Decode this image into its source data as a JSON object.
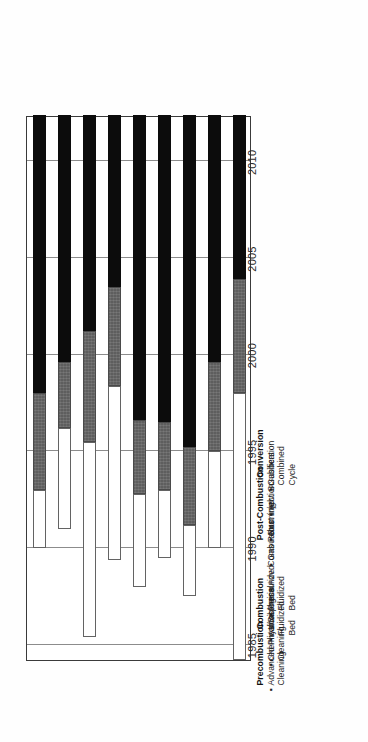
{
  "chart_data": {
    "type": "bar",
    "orientation": "rotated-90-ccw-gantt",
    "title": "",
    "xlabel": "",
    "ylabel": "",
    "axis": {
      "name": "Year",
      "min": 1984.2,
      "max": 2012.4,
      "ticks": [
        "1985",
        "1990",
        "1995",
        "2000",
        "2005",
        "2010"
      ],
      "tick_values": [
        1985,
        1990,
        1995,
        2000,
        2005,
        2010
      ],
      "grid": true
    },
    "legend": {
      "position": "right",
      "entries": [
        {
          "label": "Demonstrations",
          "color": "#ffffff",
          "key": "demo"
        },
        {
          "label": "1st Commercial Plants",
          "color": "#5e5e5e",
          "key": "commercial"
        },
        {
          "label": "Widespread Use",
          "color": "#0c0c0c",
          "key": "widespread"
        }
      ]
    },
    "groups": [
      {
        "heading": "Precombustion",
        "first_index": 0,
        "count": 2
      },
      {
        "heading": "Combustion",
        "first_index": 2,
        "count": 2
      },
      {
        "heading": "",
        "first_index": 4,
        "count": 2
      },
      {
        "heading": "Post-Combustion",
        "first_index": 6,
        "count": 2
      },
      {
        "heading": "Conversion",
        "first_index": 8,
        "count": 1
      }
    ],
    "categories": [
      "Advanced Physical Cleaning",
      "Chemical/Biological Cleaning",
      "Atmospheric Fluidized Bed",
      "Pressurized Fluidized Bed",
      "Adv. Combustors",
      "Gas Reburning",
      "Duct Injection",
      "Adv. Scrubbers",
      "Gasification Combined Cycle"
    ],
    "bars": [
      {
        "category": "Advanced Physical Cleaning",
        "label_lines": [
          "Advanced Physical",
          "Cleaning"
        ],
        "group": "Precombustion",
        "segments": [
          {
            "key": "demo",
            "name": "Demonstrations",
            "start": 1990.0,
            "end": 1993.0
          },
          {
            "key": "commercial",
            "name": "1st Commercial Plants",
            "start": 1993.0,
            "end": 1998.0
          },
          {
            "key": "widespread",
            "name": "Widespread Use",
            "start": 1998.0,
            "end": 2012.4
          }
        ]
      },
      {
        "category": "Chemical/Biological Cleaning",
        "label_lines": [
          "Chemical/Biological",
          "Cleaning"
        ],
        "group": "Precombustion",
        "segments": [
          {
            "key": "demo",
            "name": "Demonstrations",
            "start": 1991.0,
            "end": 1996.2
          },
          {
            "key": "commercial",
            "name": "1st Commercial Plants",
            "start": 1996.2,
            "end": 1999.6
          },
          {
            "key": "widespread",
            "name": "Widespread Use",
            "start": 1999.6,
            "end": 2012.4
          }
        ]
      },
      {
        "category": "Atmospheric Fluidized Bed",
        "label_lines": [
          "Atmospheric Fluidized",
          "Bed"
        ],
        "group": "Combustion",
        "segments": [
          {
            "key": "demo",
            "name": "Demonstrations",
            "start": 1985.4,
            "end": 1995.5
          },
          {
            "key": "commercial",
            "name": "1st Commercial Plants",
            "start": 1995.5,
            "end": 2001.2
          },
          {
            "key": "widespread",
            "name": "Widespread Use",
            "start": 2001.2,
            "end": 2012.4
          }
        ]
      },
      {
        "category": "Pressurized Fluidized Bed",
        "label_lines": [
          "Pressurized Fluidized",
          "Bed"
        ],
        "group": "Combustion",
        "segments": [
          {
            "key": "demo",
            "name": "Demonstrations",
            "start": 1989.4,
            "end": 1998.4
          },
          {
            "key": "commercial",
            "name": "1st Commercial Plants",
            "start": 1998.4,
            "end": 2003.5
          },
          {
            "key": "widespread",
            "name": "Widespread Use",
            "start": 2003.5,
            "end": 2012.4
          }
        ]
      },
      {
        "category": "Adv. Combustors",
        "label_lines": [
          "Adv. Combustors"
        ],
        "group": "Combustion",
        "segments": [
          {
            "key": "demo",
            "name": "Demonstrations",
            "start": 1988.0,
            "end": 1992.8
          },
          {
            "key": "commercial",
            "name": "1st Commercial Plants",
            "start": 1992.8,
            "end": 1996.6
          },
          {
            "key": "widespread",
            "name": "Widespread Use",
            "start": 1996.6,
            "end": 2012.4
          }
        ]
      },
      {
        "category": "Gas Reburning",
        "label_lines": [
          "Gas Reburning"
        ],
        "group": "Combustion",
        "segments": [
          {
            "key": "demo",
            "name": "Demonstrations",
            "start": 1989.5,
            "end": 1993.0
          },
          {
            "key": "commercial",
            "name": "1st Commercial Plants",
            "start": 1993.0,
            "end": 1996.5
          },
          {
            "key": "widespread",
            "name": "Widespread Use",
            "start": 1996.5,
            "end": 2012.4
          }
        ]
      },
      {
        "category": "Duct Injection",
        "label_lines": [
          "Duct Injection"
        ],
        "group": "Post-Combustion",
        "segments": [
          {
            "key": "demo",
            "name": "Demonstrations",
            "start": 1987.5,
            "end": 1991.2
          },
          {
            "key": "commercial",
            "name": "1st Commercial Plants",
            "start": 1991.2,
            "end": 1995.2
          },
          {
            "key": "widespread",
            "name": "Widespread Use",
            "start": 1995.2,
            "end": 2012.4
          }
        ]
      },
      {
        "category": "Adv. Scrubbers",
        "label_lines": [
          "Adv. Scrubbers"
        ],
        "group": "Post-Combustion",
        "segments": [
          {
            "key": "demo",
            "name": "Demonstrations",
            "start": 1990.0,
            "end": 1995.0
          },
          {
            "key": "commercial",
            "name": "1st Commercial Plants",
            "start": 1995.0,
            "end": 1999.6
          },
          {
            "key": "widespread",
            "name": "Widespread Use",
            "start": 1999.6,
            "end": 2012.4
          }
        ]
      },
      {
        "category": "Gasification Combined Cycle",
        "label_lines": [
          "Gasification Combined",
          "Cycle"
        ],
        "group": "Conversion",
        "segments": [
          {
            "key": "demo",
            "name": "Demonstrations",
            "start": 1984.2,
            "end": 1998.0
          },
          {
            "key": "commercial",
            "name": "1st Commercial Plants",
            "start": 1998.0,
            "end": 2003.9
          },
          {
            "key": "widespread",
            "name": "Widespread Use",
            "start": 2003.9,
            "end": 2012.4
          }
        ]
      }
    ]
  },
  "bullet": "▪"
}
